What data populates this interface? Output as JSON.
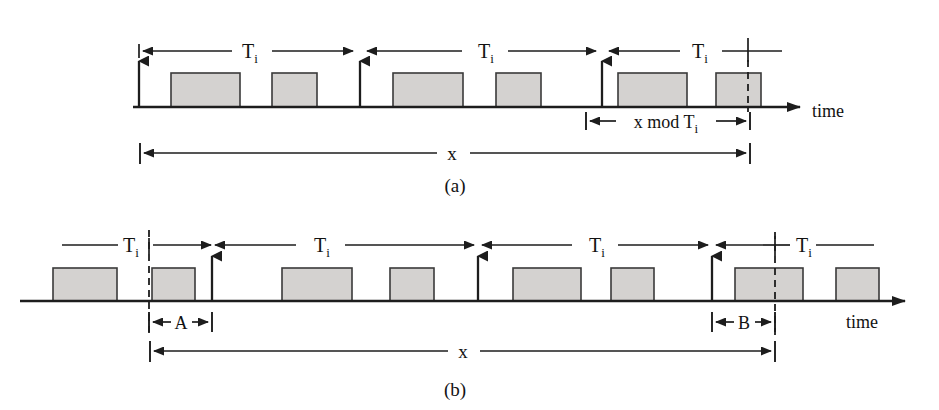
{
  "figure": {
    "background_color": "#ffffff",
    "pulse_fill": "#d4d2d0",
    "line_color": "#1d1d1d",
    "width": 939,
    "height": 410
  },
  "panel_a": {
    "caption": "(a)",
    "axis_label": "time",
    "total_label": "x",
    "remainder_label": "x mod T",
    "remainder_sub": "i",
    "period_label": "T",
    "period_sub": "i",
    "periods": [
      {
        "label": "T",
        "sub": "i",
        "x1": 139,
        "x2": 357,
        "text_x": 250
      },
      {
        "label": "T",
        "sub": "i",
        "x1": 362,
        "x2": 600,
        "text_x": 486
      },
      {
        "label": "T",
        "sub": "i",
        "x1": 605,
        "x2": 770,
        "text_x": 700
      }
    ],
    "pulses": [
      {
        "x": 171,
        "w": 69
      },
      {
        "x": 272,
        "w": 45
      },
      {
        "x": 393,
        "w": 70
      },
      {
        "x": 496,
        "w": 45
      },
      {
        "x": 618,
        "w": 69
      },
      {
        "x": 716,
        "w": 45
      }
    ],
    "release_arrows": [
      139,
      360,
      602
    ],
    "dashed_marker_x": 748,
    "baseline_y": 107,
    "pulse_top_y": 73,
    "axis_x_start": 133,
    "axis_x_end": 800,
    "total_span": {
      "x1": 140,
      "x2": 750,
      "y": 153,
      "text_x": 452
    },
    "remainder_span": {
      "x1": 586,
      "x2": 750,
      "y": 120,
      "text_x": 668
    },
    "time_text_x": 812,
    "time_text_y": 117,
    "caption_x": 455,
    "caption_y": 186
  },
  "panel_b": {
    "caption": "(b)",
    "axis_label": "time",
    "total_label": "x",
    "segment_a_label": "A",
    "segment_b_label": "B",
    "period_label": "T",
    "period_sub": "i",
    "periods": [
      {
        "label": "T",
        "sub": "i",
        "x1": 60,
        "x2": 152,
        "text_x": 131,
        "open_left": true
      },
      {
        "label": "T",
        "sub": "i",
        "x1": 165,
        "x2": 455,
        "text_x": 322
      },
      {
        "label": "T",
        "sub": "i",
        "x1": 460,
        "x2": 700,
        "text_x": 597
      },
      {
        "label": "T",
        "sub": "i",
        "x1": 706,
        "x2": 840,
        "text_x": 789,
        "open_right": true
      }
    ],
    "pulses": [
      {
        "x": 53,
        "w": 64
      },
      {
        "x": 152,
        "w": 43
      },
      {
        "x": 282,
        "w": 70
      },
      {
        "x": 390,
        "w": 44
      },
      {
        "x": 513,
        "w": 68
      },
      {
        "x": 611,
        "w": 43
      },
      {
        "x": 735,
        "w": 68
      },
      {
        "x": 836,
        "w": 43
      }
    ],
    "release_arrows": [
      212,
      478,
      712
    ],
    "dashed_marker_x": 149,
    "dashed_marker_x2": 775,
    "baseline_y": 301,
    "pulse_top_y": 268,
    "axis_x_start": 20,
    "axis_x_end": 905,
    "segment_a_span": {
      "x1": 149,
      "x2": 212,
      "y": 322,
      "text_x": 181
    },
    "segment_b_span": {
      "x1": 712,
      "x2": 775,
      "y": 322,
      "text_x": 744
    },
    "total_span": {
      "x1": 150,
      "x2": 775,
      "y": 351,
      "text_x": 463
    },
    "time_text_x": 862,
    "time_text_y": 322,
    "caption_x": 455,
    "caption_y": 390
  }
}
